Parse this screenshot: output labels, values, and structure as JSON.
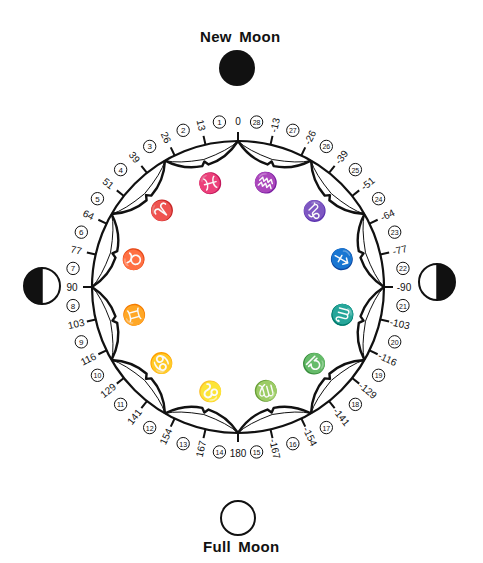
{
  "diagram": {
    "center": [
      238,
      287
    ],
    "radius": 146,
    "stroke_color": "#111111",
    "background": "#ffffff"
  },
  "moons": [
    {
      "id": "new",
      "label": "New Moon",
      "phase": "new",
      "cx": 237,
      "cy": 68,
      "r": 18,
      "label_x": 200,
      "label_y": 27
    },
    {
      "id": "first-quarter-left",
      "label": "",
      "phase": "left-dark",
      "cx": 42,
      "cy": 286,
      "r": 18
    },
    {
      "id": "last-quarter-right",
      "label": "",
      "phase": "right-dark",
      "cx": 437,
      "cy": 282,
      "r": 18
    },
    {
      "id": "full",
      "label": "Full Moon",
      "phase": "full",
      "cx": 238,
      "cy": 518,
      "r": 17,
      "label_x": 203,
      "label_y": 538
    }
  ],
  "labels": {
    "new_moon": "New Moon",
    "full_moon": "Full Moon"
  },
  "degree_ticks": [
    {
      "angle": 0,
      "label": "0"
    },
    {
      "angle": 12.857,
      "label": "13"
    },
    {
      "angle": 25.714,
      "label": "26"
    },
    {
      "angle": 38.571,
      "label": "39"
    },
    {
      "angle": 51.429,
      "label": "51"
    },
    {
      "angle": 64.286,
      "label": "64"
    },
    {
      "angle": 77.143,
      "label": "77"
    },
    {
      "angle": 90,
      "label": "90"
    },
    {
      "angle": 102.857,
      "label": "103"
    },
    {
      "angle": 115.714,
      "label": "116"
    },
    {
      "angle": 128.571,
      "label": "129"
    },
    {
      "angle": 141.429,
      "label": "141"
    },
    {
      "angle": 154.286,
      "label": "154"
    },
    {
      "angle": 167.143,
      "label": "167"
    },
    {
      "angle": 180,
      "label": "180"
    },
    {
      "angle": -12.857,
      "label": "-13"
    },
    {
      "angle": -25.714,
      "label": "-26"
    },
    {
      "angle": -38.571,
      "label": "-39"
    },
    {
      "angle": -51.429,
      "label": "-51"
    },
    {
      "angle": -64.286,
      "label": "-64"
    },
    {
      "angle": -77.143,
      "label": "-77"
    },
    {
      "angle": -90,
      "label": "-90"
    },
    {
      "angle": -102.857,
      "label": "-103"
    },
    {
      "angle": -115.714,
      "label": "-116"
    },
    {
      "angle": -128.571,
      "label": "-129"
    },
    {
      "angle": -141.429,
      "label": "-141"
    },
    {
      "angle": -154.286,
      "label": "-154"
    },
    {
      "angle": -167.143,
      "label": "-167"
    }
  ],
  "lunar_days": [
    {
      "day": "1",
      "angle": 6.43
    },
    {
      "day": "2",
      "angle": 19.29
    },
    {
      "day": "3",
      "angle": 32.14
    },
    {
      "day": "4",
      "angle": 45.0
    },
    {
      "day": "5",
      "angle": 57.86
    },
    {
      "day": "6",
      "angle": 70.71
    },
    {
      "day": "7",
      "angle": 83.57
    },
    {
      "day": "8",
      "angle": 96.43
    },
    {
      "day": "9",
      "angle": 109.29
    },
    {
      "day": "10",
      "angle": 122.14
    },
    {
      "day": "11",
      "angle": 135.0
    },
    {
      "day": "12",
      "angle": 147.86
    },
    {
      "day": "13",
      "angle": 160.71
    },
    {
      "day": "14",
      "angle": 173.57
    },
    {
      "day": "15",
      "angle": -173.57
    },
    {
      "day": "16",
      "angle": -160.71
    },
    {
      "day": "17",
      "angle": -147.86
    },
    {
      "day": "18",
      "angle": -135.0
    },
    {
      "day": "19",
      "angle": -122.14
    },
    {
      "day": "20",
      "angle": -109.29
    },
    {
      "day": "21",
      "angle": -96.43
    },
    {
      "day": "22",
      "angle": -83.57
    },
    {
      "day": "23",
      "angle": -70.71
    },
    {
      "day": "24",
      "angle": -57.86
    },
    {
      "day": "25",
      "angle": -45.0
    },
    {
      "day": "26",
      "angle": -32.14
    },
    {
      "day": "27",
      "angle": -19.29
    },
    {
      "day": "28",
      "angle": -6.43
    }
  ],
  "zodiac": [
    {
      "name": "pisces",
      "glyph": "♓",
      "mid_angle": 15
    },
    {
      "name": "aries",
      "glyph": "♈",
      "mid_angle": 45
    },
    {
      "name": "taurus",
      "glyph": "♉",
      "mid_angle": 75
    },
    {
      "name": "gemini",
      "glyph": "♊",
      "mid_angle": 105
    },
    {
      "name": "cancer",
      "glyph": "♋",
      "mid_angle": 135
    },
    {
      "name": "leo",
      "glyph": "♌",
      "mid_angle": 165
    },
    {
      "name": "virgo",
      "glyph": "♍",
      "mid_angle": -165
    },
    {
      "name": "libra",
      "glyph": "♎",
      "mid_angle": -135
    },
    {
      "name": "scorpio",
      "glyph": "♏",
      "mid_angle": -105
    },
    {
      "name": "sagittarius",
      "glyph": "♐",
      "mid_angle": -75
    },
    {
      "name": "capricorn",
      "glyph": "♑",
      "mid_angle": -45
    },
    {
      "name": "aquarius",
      "glyph": "♒",
      "mid_angle": -15
    }
  ]
}
